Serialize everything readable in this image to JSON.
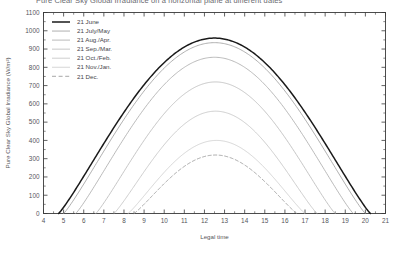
{
  "chart_data": {
    "type": "line",
    "title": "Pure Clear Sky Global Irradiance on a horizontal plane at different dates",
    "xlabel": "Legal time",
    "ylabel": "Pure Clear Sky Global Irradiance (W/m²)",
    "xlim": [
      4,
      21
    ],
    "ylim": [
      0,
      1100
    ],
    "xticks": [
      4,
      5,
      6,
      7,
      8,
      9,
      10,
      11,
      12,
      13,
      14,
      15,
      16,
      17,
      18,
      19,
      20,
      21
    ],
    "yticks": [
      0,
      100,
      200,
      300,
      400,
      500,
      600,
      700,
      800,
      900,
      1000,
      1100
    ],
    "xtick_labels": [
      "4",
      "5",
      "6",
      "7",
      "8",
      "9",
      "10",
      "11",
      "12",
      "13",
      "14",
      "15",
      "16",
      "17",
      "18",
      "19",
      "20",
      "21"
    ],
    "ytick_labels": [
      "0",
      "100",
      "200",
      "300",
      "400",
      "500",
      "600",
      "700",
      "800",
      "900",
      "1000",
      "1100"
    ],
    "grid": false,
    "legend_position": "top-left",
    "minor_ticks": true,
    "series": [
      {
        "name": "21 June",
        "style": "solid",
        "color": "#1a1a1a",
        "width": 1.5,
        "peak": 960,
        "peak_time": 13.0,
        "sunrise": 4.75,
        "sunset": 20.25
      },
      {
        "name": "21 July/May",
        "style": "solid",
        "color": "#9a9a9a",
        "width": 0.8,
        "peak": 935,
        "peak_time": 13.0,
        "sunrise": 5.0,
        "sunset": 20.0
      },
      {
        "name": "21 Aug./Apr.",
        "style": "solid",
        "color": "#a8a8a8",
        "width": 0.8,
        "peak": 855,
        "peak_time": 13.0,
        "sunrise": 5.6,
        "sunset": 19.4
      },
      {
        "name": "21 Sep./Mar.",
        "style": "solid",
        "color": "#b8b8b8",
        "width": 0.8,
        "peak": 720,
        "peak_time": 13.0,
        "sunrise": 6.6,
        "sunset": 18.5
      },
      {
        "name": "21 Oct./Feb.",
        "style": "solid",
        "color": "#c2c2c2",
        "width": 0.8,
        "peak": 560,
        "peak_time": 13.0,
        "sunrise": 7.5,
        "sunset": 17.6
      },
      {
        "name": "21 Nov./Jan.",
        "style": "solid",
        "color": "#cccccc",
        "width": 0.8,
        "peak": 400,
        "peak_time": 12.9,
        "sunrise": 8.2,
        "sunset": 17.0
      },
      {
        "name": "21 Dec.",
        "style": "dashed",
        "color": "#9e9e9e",
        "width": 0.9,
        "peak": 320,
        "peak_time": 12.9,
        "sunrise": 8.5,
        "sunset": 16.6
      }
    ]
  },
  "legend": {
    "entries": [
      "21 June",
      "21 July/May",
      "21 Aug./Apr.",
      "21 Sep./Mar.",
      "21 Oct./Feb.",
      "21 Nov./Jan.",
      "21 Dec."
    ]
  },
  "axes": {
    "x_title": "Legal time",
    "y_title": "Pure Clear Sky Global Irradiance (W/m²)"
  },
  "colors": {
    "frame": "#3a3a3a",
    "primary_series": "#1a1a1a",
    "background": "#ffffff"
  }
}
